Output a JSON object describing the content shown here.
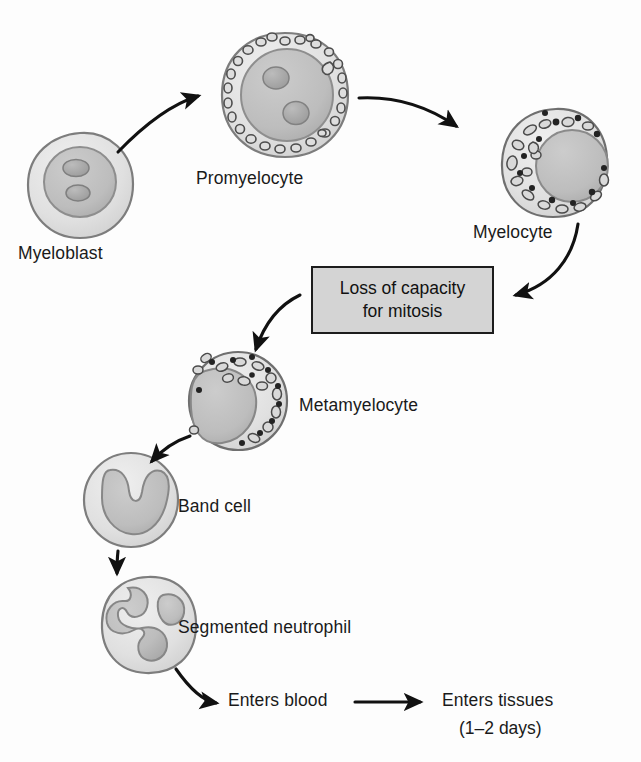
{
  "figure": {
    "background_color": "#fdfdfd",
    "ink_color": "#1c1c1c"
  },
  "palette": {
    "cytoplasm_light": "#e2e2e2",
    "cytoplasm_mid": "#d3d3d3",
    "nucleus": "#b9b9b9",
    "nucleolus": "#a5a5a5",
    "granule_stroke": "#5a5a5a",
    "granule_dark": "#2b2b2b",
    "box_fill": "#d4d4d4",
    "outline": "#6e6e6e"
  },
  "cells": [
    {
      "id": "myeloblast",
      "label": "Myeloblast",
      "label_x": 18,
      "label_y": 243,
      "cx": 80,
      "cy": 185,
      "r": 52,
      "nucleus_type": "round-large",
      "nucleoli": 2,
      "granules": 0
    },
    {
      "id": "promyelocyte",
      "label": "Promyelocyte",
      "label_x": 196,
      "label_y": 168,
      "cx": 285,
      "cy": 95,
      "r": 62,
      "nucleus_type": "round-large",
      "nucleoli": 2,
      "granules": 30
    },
    {
      "id": "myelocyte",
      "label": "Myelocyte",
      "label_x": 473,
      "label_y": 222,
      "cx": 555,
      "cy": 163,
      "r": 52,
      "nucleus_type": "round-eccentric",
      "nucleoli": 0,
      "granules": 26
    },
    {
      "id": "metamyelocyte",
      "label": "Metamyelocyte",
      "label_x": 299,
      "label_y": 395,
      "cx": 238,
      "cy": 401,
      "r": 49,
      "nucleus_type": "kidney",
      "nucleoli": 0,
      "granules": 24
    },
    {
      "id": "band-cell",
      "label": "Band cell",
      "label_x": 178,
      "label_y": 496,
      "cx": 131,
      "cy": 500,
      "r": 47,
      "nucleus_type": "band",
      "nucleoli": 0,
      "granules": 0
    },
    {
      "id": "segmented-neutrophil",
      "label": "Segmented neutrophil",
      "label_x": 178,
      "label_y": 617,
      "cx": 148,
      "cy": 625,
      "r": 48,
      "nucleus_type": "segmented",
      "nucleoli": 0,
      "granules": 0
    }
  ],
  "callout_box": {
    "text": "Loss of capacity\nfor mitosis",
    "line1": "Loss of capacity",
    "line2": "for mitosis",
    "x": 311,
    "y": 266,
    "width": 183,
    "height": 68
  },
  "fate": {
    "enters_blood": "Enters blood",
    "enters_blood_x": 228,
    "enters_blood_y": 700,
    "enters_tissues": "Enters tissues",
    "enters_tissues_x": 442,
    "enters_tissues_y": 700,
    "duration": "(1–2 days)",
    "duration_x": 459,
    "duration_y": 728
  },
  "arrows": [
    {
      "id": "myeloblast-to-promyelocyte",
      "from": "myeloblast",
      "to": "promyelocyte"
    },
    {
      "id": "promyelocyte-to-myelocyte",
      "from": "promyelocyte",
      "to": "myelocyte"
    },
    {
      "id": "myelocyte-to-box",
      "from": "myelocyte",
      "to": "callout-box"
    },
    {
      "id": "box-to-metamyelocyte",
      "from": "callout-box",
      "to": "metamyelocyte"
    },
    {
      "id": "metamyelocyte-to-band-cell",
      "from": "metamyelocyte",
      "to": "band-cell"
    },
    {
      "id": "band-cell-to-neutrophil",
      "from": "band-cell",
      "to": "segmented-neutrophil"
    },
    {
      "id": "neutrophil-to-blood",
      "from": "segmented-neutrophil",
      "to": "enters-blood"
    },
    {
      "id": "blood-to-tissues",
      "from": "enters-blood",
      "to": "enters-tissues"
    }
  ]
}
